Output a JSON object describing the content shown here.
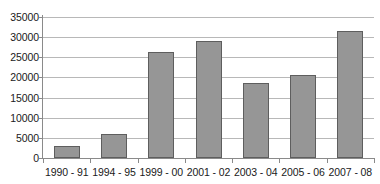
{
  "chart_data": {
    "type": "bar",
    "title": "",
    "subtitle": "",
    "xlabel": "",
    "ylabel": "",
    "categories": [
      "1990 - 91",
      "1994 - 95",
      "1999 - 00",
      "2001 - 02",
      "2003 - 04",
      "2005 - 06",
      "2007 - 08"
    ],
    "values": [
      3000,
      6000,
      26300,
      29100,
      18700,
      20600,
      31500
    ],
    "series": [
      {
        "name": "",
        "values": [
          3000,
          6000,
          26300,
          29100,
          18700,
          20600,
          31500
        ]
      }
    ],
    "ylim": [
      0,
      35000
    ],
    "ytick_labels": [
      "0",
      "5000",
      "10000",
      "15000",
      "20000",
      "25000",
      "30000",
      "35000"
    ],
    "ytick_values": [
      0,
      5000,
      10000,
      15000,
      20000,
      25000,
      30000,
      35000
    ],
    "grid": true,
    "legend": false,
    "legend_position": "none",
    "bar_color": "#969696",
    "bar_border_color": "#5e5e5e",
    "gridline_color": "#b8b8b8",
    "axis_color": "#8a8a8a",
    "text_color": "#1a1a1a",
    "background_color": "#ffffff"
  }
}
